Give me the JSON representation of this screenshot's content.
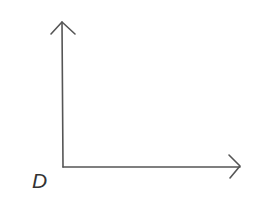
{
  "diagram": {
    "type": "coordinate-axes",
    "origin_label": "D",
    "axes": [
      {
        "name": "vertical-axis",
        "direction": "up",
        "arrowhead": true
      },
      {
        "name": "horizontal-axis",
        "direction": "right",
        "arrowhead": true
      }
    ],
    "stroke_color": "#555555",
    "label_color": "#333333",
    "background": "#ffffff"
  }
}
